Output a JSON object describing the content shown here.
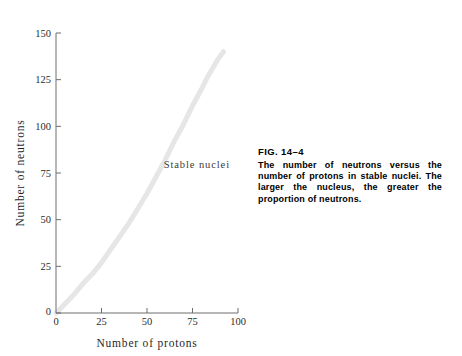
{
  "figure": {
    "caption_label": "FIG. 14–4",
    "caption_body": "The number of neutrons versus the number of protons in stable nuclei. The larger the nucleus, the greater the proportion of neutrons.",
    "annotation": "Stable  nuclei",
    "band_color": "#e6e6e6",
    "axis_color": "#6e6e6e",
    "text_color": "#1f1f1f"
  },
  "chart_data": {
    "type": "line",
    "title": "",
    "xlabel": "Number  of  protons",
    "ylabel": "Number  of  neutrons",
    "xlim": [
      0,
      100
    ],
    "ylim": [
      0,
      150
    ],
    "xticks": [
      0,
      25,
      50,
      75,
      100
    ],
    "yticks": [
      0,
      25,
      50,
      75,
      100,
      125,
      150
    ],
    "xticklabels": [
      "0",
      "25",
      "50",
      "75",
      "100"
    ],
    "yticklabels": [
      "0",
      "25",
      "50",
      "75",
      "100",
      "125",
      "150"
    ],
    "grid": false,
    "legend": false,
    "annotations": [
      {
        "text": "Stable  nuclei",
        "x": 62,
        "y": 80
      }
    ],
    "series": [
      {
        "name": "Stable nuclei band",
        "color": "#e6e6e6",
        "linewidth_data_units": 3,
        "x": [
          0,
          5,
          10,
          15,
          20,
          25,
          30,
          35,
          40,
          45,
          50,
          55,
          60,
          65,
          70,
          75,
          80,
          83,
          86,
          89,
          92
        ],
        "y": [
          0,
          5,
          10,
          16,
          21,
          27,
          34,
          41,
          48,
          56,
          64,
          73,
          82,
          92,
          101,
          111,
          120,
          126,
          131,
          136,
          140
        ]
      }
    ]
  }
}
